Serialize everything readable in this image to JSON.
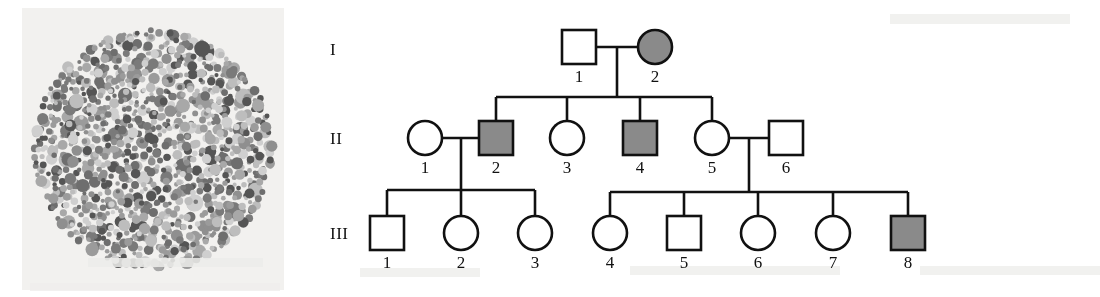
{
  "figure": {
    "type": "pedigree-with-ishihara-plate",
    "panels": [
      "color-vision-test-plate",
      "family-pedigree-chart"
    ]
  },
  "plate": {
    "name": "ishihara-color-vision-test-plate",
    "shape": "circle",
    "center": {
      "x": 153,
      "y": 149
    },
    "radius": 122,
    "backing_color": "#f2f1ef",
    "dot_palette": [
      "#8f8f8f",
      "#a8a8a8",
      "#6e6e6e",
      "#bdbdbd",
      "#555555",
      "#9b9b9b",
      "#cfcfcf",
      "#7a7a7a"
    ],
    "dot_count": 1100,
    "rendering": "grayscale reproduction of a pseudoisochromatic plate"
  },
  "pedigree": {
    "name": "family-pedigree-chart",
    "generation_labels": [
      "I",
      "II",
      "III"
    ],
    "generation_label_x": 30,
    "generation_label_y": [
      40,
      129,
      224
    ],
    "legend": {
      "affected_fill": "#8a8a8a",
      "unaffected_fill": "#ffffff",
      "stroke": "#111111",
      "square_means": "male",
      "circle_means": "female",
      "filled_means": "affected"
    },
    "individuals": [
      {
        "id": "I-1",
        "generation": "I",
        "number": "1",
        "sex": "male",
        "shape": "square",
        "affected": false,
        "x": 279,
        "y": 47
      },
      {
        "id": "I-2",
        "generation": "I",
        "number": "2",
        "sex": "female",
        "shape": "circle",
        "affected": true,
        "x": 355,
        "y": 47
      },
      {
        "id": "II-1",
        "generation": "II",
        "number": "1",
        "sex": "female",
        "shape": "circle",
        "affected": false,
        "x": 125,
        "y": 138
      },
      {
        "id": "II-2",
        "generation": "II",
        "number": "2",
        "sex": "male",
        "shape": "square",
        "affected": true,
        "x": 196,
        "y": 138
      },
      {
        "id": "II-3",
        "generation": "II",
        "number": "3",
        "sex": "female",
        "shape": "circle",
        "affected": false,
        "x": 267,
        "y": 138
      },
      {
        "id": "II-4",
        "generation": "II",
        "number": "4",
        "sex": "male",
        "shape": "square",
        "affected": true,
        "x": 340,
        "y": 138
      },
      {
        "id": "II-5",
        "generation": "II",
        "number": "5",
        "sex": "female",
        "shape": "circle",
        "affected": false,
        "x": 412,
        "y": 138
      },
      {
        "id": "II-6",
        "generation": "II",
        "number": "6",
        "sex": "male",
        "shape": "square",
        "affected": false,
        "x": 486,
        "y": 138
      },
      {
        "id": "III-1",
        "generation": "III",
        "number": "1",
        "sex": "male",
        "shape": "square",
        "affected": false,
        "x": 87,
        "y": 233
      },
      {
        "id": "III-2",
        "generation": "III",
        "number": "2",
        "sex": "female",
        "shape": "circle",
        "affected": false,
        "x": 161,
        "y": 233
      },
      {
        "id": "III-3",
        "generation": "III",
        "number": "3",
        "sex": "female",
        "shape": "circle",
        "affected": false,
        "x": 235,
        "y": 233
      },
      {
        "id": "III-4",
        "generation": "III",
        "number": "4",
        "sex": "female",
        "shape": "circle",
        "affected": false,
        "x": 310,
        "y": 233
      },
      {
        "id": "III-5",
        "generation": "III",
        "number": "5",
        "sex": "male",
        "shape": "square",
        "affected": false,
        "x": 384,
        "y": 233
      },
      {
        "id": "III-6",
        "generation": "III",
        "number": "6",
        "sex": "female",
        "shape": "circle",
        "affected": false,
        "x": 458,
        "y": 233
      },
      {
        "id": "III-7",
        "generation": "III",
        "number": "7",
        "sex": "female",
        "shape": "circle",
        "affected": false,
        "x": 533,
        "y": 233
      },
      {
        "id": "III-8",
        "generation": "III",
        "number": "8",
        "sex": "male",
        "shape": "square",
        "affected": true,
        "x": 608,
        "y": 233
      }
    ],
    "matings": [
      {
        "id": "mating-I",
        "partners": [
          "I-1",
          "I-2"
        ],
        "drop_x": 317,
        "drop_y": 47,
        "sibship_y": 97,
        "children": [
          "II-2",
          "II-3",
          "II-4",
          "II-5"
        ]
      },
      {
        "id": "mating-II-1-2",
        "partners": [
          "II-1",
          "II-2"
        ],
        "drop_x": 161,
        "drop_y": 138,
        "sibship_y": 190,
        "children": [
          "III-1",
          "III-2",
          "III-3"
        ]
      },
      {
        "id": "mating-II-5-6",
        "partners": [
          "II-5",
          "II-6"
        ],
        "drop_x": 449,
        "drop_y": 138,
        "sibship_y": 192,
        "children": [
          "III-4",
          "III-5",
          "III-6",
          "III-7",
          "III-8"
        ]
      }
    ]
  }
}
